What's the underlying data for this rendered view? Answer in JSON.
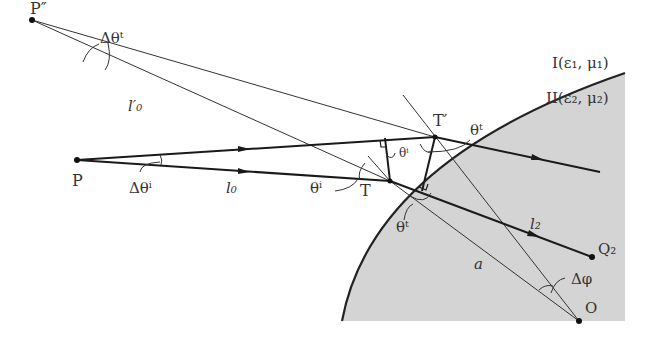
{
  "diagram": {
    "points": {
      "P_double_prime": {
        "label": "P″",
        "x": 32,
        "y": 20
      },
      "P": {
        "label": "P",
        "x": 77,
        "y": 160
      },
      "T": {
        "label": "T",
        "x": 390,
        "y": 181
      },
      "T_prime": {
        "label": "T′",
        "x": 435,
        "y": 137
      },
      "Q2": {
        "label": "Q₂",
        "x": 592,
        "y": 257
      },
      "O": {
        "label": "O",
        "x": 579,
        "y": 321
      }
    },
    "labels": {
      "delta_theta_t": "Δθᵗ",
      "l0_prime": "l′₀",
      "delta_theta_i": "Δθⁱ",
      "l0": "l₀",
      "theta_i_left": "θⁱ",
      "theta_i_small": "θⁱ",
      "theta_t_top": "θᵗ",
      "theta_t_bottom": "θᵗ",
      "l2": "l₂",
      "a": "a",
      "delta_phi": "Δφ"
    },
    "media": {
      "medium1": "I(ε₁, μ₁)",
      "medium2": "II(ε₂, μ₂)"
    },
    "colors": {
      "region2_fill": "#d4d4d4",
      "line": "#222222"
    }
  }
}
